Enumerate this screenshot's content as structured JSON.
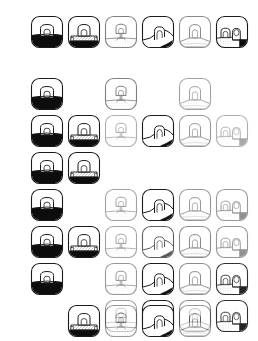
{
  "canvas": {
    "width": 258,
    "height": 341,
    "background": "#ffffff"
  },
  "palette": {
    "stroke": "#1a1a1a",
    "fill_dark": "#0d0d0d",
    "fill_light": "#ffffff",
    "hatch": "#808080"
  },
  "grid": {
    "columns": 6,
    "rows": 9,
    "cell_size": 36,
    "column_x": [
      29,
      66,
      103,
      140,
      177,
      214
    ],
    "row_y": [
      14,
      76,
      113,
      150,
      187,
      224,
      261,
      298,
      0
    ],
    "row_y_all": [
      14,
      76,
      113,
      150,
      187,
      224,
      261,
      298,
      303
    ]
  },
  "icon_variants": [
    {
      "id": "variant-1",
      "name": "dome-solid-base-icon",
      "description": "rounded tile with small dome and solid dark lower half",
      "dome_width": 13,
      "dome_height": 14,
      "base_fill": "solid-dark",
      "ground_fill": "none"
    },
    {
      "id": "variant-2",
      "name": "dome-platform-icon",
      "description": "rounded tile with dome on a hatched platform and dark base strip",
      "dome_width": 13,
      "dome_height": 14,
      "base_fill": "dark-strip",
      "ground_fill": "platform"
    },
    {
      "id": "variant-3",
      "name": "dome-pedestal-icon",
      "description": "rounded tile with dome on thin pedestal over light hatched ground",
      "dome_width": 12,
      "dome_height": 12,
      "base_fill": "none",
      "ground_fill": "hatched-light"
    },
    {
      "id": "variant-4",
      "name": "arch-corner-dark-icon",
      "description": "rounded tile with arch opening and dark wedge at lower right corner",
      "dome_width": 12,
      "dome_height": 14,
      "base_fill": "corner-wedge",
      "ground_fill": "slope"
    },
    {
      "id": "variant-5",
      "name": "dome-mound-icon",
      "description": "rounded tile with wide dome atop a stippled mound",
      "dome_width": 13,
      "dome_height": 14,
      "base_fill": "none",
      "ground_fill": "mound"
    },
    {
      "id": "variant-6",
      "name": "dome-pair-corner-icon",
      "description": "rounded tile with two overlapping domes and dark corner block",
      "dome_width": 11,
      "dome_height": 11,
      "base_fill": "corner-block",
      "ground_fill": "hatched-light"
    }
  ],
  "cells": [
    {
      "col": 0,
      "row": 0,
      "variant": 0,
      "opacity": 1.0
    },
    {
      "col": 1,
      "row": 0,
      "variant": 1,
      "opacity": 1.0
    },
    {
      "col": 2,
      "row": 0,
      "variant": 2,
      "opacity": 0.55
    },
    {
      "col": 3,
      "row": 0,
      "variant": 3,
      "opacity": 1.0
    },
    {
      "col": 4,
      "row": 0,
      "variant": 4,
      "opacity": 0.5
    },
    {
      "col": 5,
      "row": 0,
      "variant": 5,
      "opacity": 1.0
    },
    {
      "col": 0,
      "row": 1,
      "variant": 0,
      "opacity": 1.0
    },
    {
      "col": 2,
      "row": 1,
      "variant": 2,
      "opacity": 0.55
    },
    {
      "col": 4,
      "row": 1,
      "variant": 4,
      "opacity": 0.4
    },
    {
      "col": 0,
      "row": 2,
      "variant": 0,
      "opacity": 1.0
    },
    {
      "col": 1,
      "row": 2,
      "variant": 1,
      "opacity": 1.0
    },
    {
      "col": 2,
      "row": 2,
      "variant": 2,
      "opacity": 0.35
    },
    {
      "col": 3,
      "row": 2,
      "variant": 3,
      "opacity": 1.0
    },
    {
      "col": 4,
      "row": 2,
      "variant": 4,
      "opacity": 0.45
    },
    {
      "col": 5,
      "row": 2,
      "variant": 5,
      "opacity": 0.35
    },
    {
      "col": 0,
      "row": 3,
      "variant": 0,
      "opacity": 1.0
    },
    {
      "col": 1,
      "row": 3,
      "variant": 1,
      "opacity": 1.0
    },
    {
      "col": 0,
      "row": 4,
      "variant": 0,
      "opacity": 1.0
    },
    {
      "col": 2,
      "row": 4,
      "variant": 2,
      "opacity": 0.4
    },
    {
      "col": 3,
      "row": 4,
      "variant": 3,
      "opacity": 1.0
    },
    {
      "col": 4,
      "row": 4,
      "variant": 4,
      "opacity": 0.45
    },
    {
      "col": 5,
      "row": 4,
      "variant": 5,
      "opacity": 0.45
    },
    {
      "col": 0,
      "row": 5,
      "variant": 0,
      "opacity": 1.0
    },
    {
      "col": 1,
      "row": 5,
      "variant": 1,
      "opacity": 1.0
    },
    {
      "col": 2,
      "row": 5,
      "variant": 2,
      "opacity": 0.4
    },
    {
      "col": 3,
      "row": 5,
      "variant": 3,
      "opacity": 0.7
    },
    {
      "col": 4,
      "row": 5,
      "variant": 4,
      "opacity": 0.5
    },
    {
      "col": 5,
      "row": 5,
      "variant": 5,
      "opacity": 0.45
    },
    {
      "col": 0,
      "row": 6,
      "variant": 0,
      "opacity": 1.0
    },
    {
      "col": 2,
      "row": 6,
      "variant": 2,
      "opacity": 0.45
    },
    {
      "col": 3,
      "row": 6,
      "variant": 3,
      "opacity": 1.0
    },
    {
      "col": 4,
      "row": 6,
      "variant": 4,
      "opacity": 0.5
    },
    {
      "col": 5,
      "row": 6,
      "variant": 5,
      "opacity": 0.9
    },
    {
      "col": 2,
      "row": 7,
      "variant": 2,
      "opacity": 0.45
    },
    {
      "col": 3,
      "row": 7,
      "variant": 3,
      "opacity": 1.0
    },
    {
      "col": 4,
      "row": 7,
      "variant": 4,
      "opacity": 0.5
    },
    {
      "col": 5,
      "row": 7,
      "variant": 5,
      "opacity": 0.9
    },
    {
      "col": 1,
      "row": 8,
      "variant": 1,
      "opacity": 1.0
    },
    {
      "col": 2,
      "row": 8,
      "variant": 2,
      "opacity": 0.45
    },
    {
      "col": 3,
      "row": 8,
      "variant": 3,
      "opacity": 1.0
    },
    {
      "col": 4,
      "row": 8,
      "variant": 4,
      "opacity": 0.45
    }
  ]
}
